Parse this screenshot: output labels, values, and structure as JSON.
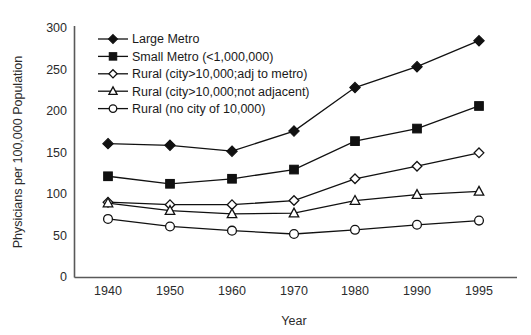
{
  "chart_data": {
    "type": "line",
    "title": "",
    "xlabel": "Year",
    "ylabel": "Physicians per 100,000 Population",
    "categories": [
      "1940",
      "1950",
      "1960",
      "1970",
      "1980",
      "1990",
      "1995"
    ],
    "x": [
      1940,
      1950,
      1960,
      1970,
      1980,
      1990,
      1995
    ],
    "xtick_labels": [
      "1940",
      "1950",
      "1960",
      "1970",
      "1980",
      "1990",
      "1995"
    ],
    "ytick_labels": [
      "0",
      "50",
      "100",
      "150",
      "200",
      "250",
      "300"
    ],
    "yticks": [
      0,
      50,
      100,
      150,
      200,
      250,
      300
    ],
    "ylim": [
      0,
      300
    ],
    "grid": false,
    "legend_position": "upper-left-inside",
    "series": [
      {
        "name": "Large Metro",
        "marker": "filled-diamond",
        "values": [
          160,
          158,
          151,
          175,
          227,
          252,
          283
        ]
      },
      {
        "name": "Small Metro (<1,000,000)",
        "marker": "filled-square",
        "values": [
          121,
          112,
          118,
          129,
          163,
          178,
          205
        ]
      },
      {
        "name": "Rural (city>10,000;adj to metro)",
        "marker": "open-diamond",
        "values": [
          90,
          87,
          87,
          92,
          118,
          133,
          149
        ]
      },
      {
        "name": "Rural (city>10,000;not adjacent)",
        "marker": "open-triangle",
        "values": [
          89,
          80,
          76,
          77,
          92,
          99,
          103
        ]
      },
      {
        "name": "Rural (no city of 10,000)",
        "marker": "open-circle",
        "values": [
          70,
          61,
          56,
          52,
          57,
          63,
          68
        ]
      }
    ]
  },
  "colors": {
    "line": "#111111",
    "axis": "#595959",
    "text": "#1a1a1a",
    "background": "#ffffff"
  }
}
